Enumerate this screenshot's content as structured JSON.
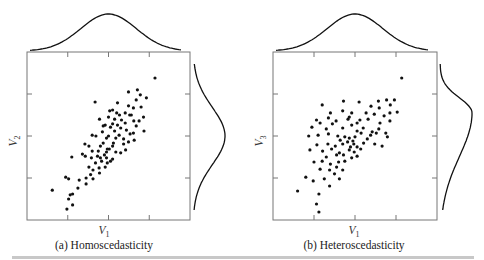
{
  "figure": {
    "bottom_rule_color": "#c8c8c8",
    "ink_color": "#111111",
    "frame_color": "#777777"
  },
  "chart_data": [
    {
      "type": "scatter",
      "title": "(a) Homoscedasticity",
      "xlabel": "V",
      "xlabel_sub": "1",
      "ylabel": "V",
      "ylabel_sub": "2",
      "xlim": [
        0,
        4
      ],
      "ylim": [
        0,
        4
      ],
      "xticks": [
        1,
        2,
        3
      ],
      "yticks": [
        1,
        2,
        3
      ],
      "tick_labels_shown": false,
      "grid": false,
      "marginals": {
        "top": "normal-symmetric",
        "right": "normal-symmetric"
      },
      "points": [
        [
          3.14,
          3.38
        ],
        [
          2.49,
          3.05
        ],
        [
          2.71,
          3.1
        ],
        [
          2.78,
          2.98
        ],
        [
          2.68,
          2.86
        ],
        [
          2.22,
          2.79
        ],
        [
          1.67,
          2.81
        ],
        [
          2.93,
          2.91
        ],
        [
          2.49,
          2.72
        ],
        [
          2.61,
          2.67
        ],
        [
          2.41,
          2.55
        ],
        [
          2.8,
          2.69
        ],
        [
          2.86,
          2.45
        ],
        [
          2.27,
          2.5
        ],
        [
          2.03,
          2.6
        ],
        [
          2.1,
          2.62
        ],
        [
          2.0,
          2.45
        ],
        [
          2.15,
          2.4
        ],
        [
          2.32,
          2.38
        ],
        [
          2.56,
          2.5
        ],
        [
          2.62,
          2.36
        ],
        [
          2.41,
          2.31
        ],
        [
          2.22,
          2.26
        ],
        [
          2.75,
          2.36
        ],
        [
          2.1,
          2.29
        ],
        [
          1.78,
          2.4
        ],
        [
          1.87,
          2.24
        ],
        [
          1.92,
          2.26
        ],
        [
          2.05,
          2.21
        ],
        [
          2.3,
          2.19
        ],
        [
          2.44,
          2.14
        ],
        [
          2.53,
          2.05
        ],
        [
          2.61,
          2.07
        ],
        [
          2.87,
          2.12
        ],
        [
          2.0,
          2.0
        ],
        [
          2.18,
          1.95
        ],
        [
          2.26,
          2.02
        ],
        [
          2.37,
          1.93
        ],
        [
          1.95,
          1.95
        ],
        [
          1.69,
          2.0
        ],
        [
          1.6,
          2.02
        ],
        [
          2.37,
          1.81
        ],
        [
          2.49,
          1.86
        ],
        [
          2.12,
          1.83
        ],
        [
          2.63,
          1.9
        ],
        [
          1.42,
          1.81
        ],
        [
          1.52,
          1.76
        ],
        [
          1.8,
          1.76
        ],
        [
          1.87,
          1.83
        ],
        [
          2.1,
          1.76
        ],
        [
          2.02,
          1.69
        ],
        [
          1.97,
          1.69
        ],
        [
          1.75,
          1.64
        ],
        [
          1.6,
          1.64
        ],
        [
          1.9,
          1.55
        ],
        [
          2.18,
          1.62
        ],
        [
          2.3,
          1.6
        ],
        [
          2.42,
          1.67
        ],
        [
          1.36,
          1.57
        ],
        [
          1.43,
          1.52
        ],
        [
          1.58,
          1.48
        ],
        [
          1.73,
          1.52
        ],
        [
          1.8,
          1.48
        ],
        [
          1.95,
          1.48
        ],
        [
          2.1,
          1.45
        ],
        [
          1.83,
          1.4
        ],
        [
          1.68,
          1.36
        ],
        [
          1.97,
          1.36
        ],
        [
          2.05,
          1.4
        ],
        [
          1.1,
          1.5
        ],
        [
          1.52,
          1.26
        ],
        [
          1.62,
          1.19
        ],
        [
          1.77,
          1.24
        ],
        [
          1.92,
          1.26
        ],
        [
          1.78,
          1.12
        ],
        [
          0.95,
          1.02
        ],
        [
          1.02,
          0.98
        ],
        [
          1.28,
          0.95
        ],
        [
          1.45,
          1.0
        ],
        [
          1.56,
          1.08
        ],
        [
          1.25,
          0.76
        ],
        [
          1.62,
          0.98
        ],
        [
          1.45,
          0.86
        ],
        [
          0.62,
          0.71
        ],
        [
          1.06,
          0.6
        ],
        [
          1.12,
          0.62
        ],
        [
          1.02,
          0.5
        ],
        [
          1.12,
          0.36
        ],
        [
          0.98,
          0.26
        ],
        [
          2.52,
          2.5
        ],
        [
          2.15,
          2.12
        ],
        [
          1.85,
          2.1
        ],
        [
          2.68,
          2.24
        ],
        [
          2.2,
          2.55
        ],
        [
          1.95,
          1.62
        ]
      ]
    },
    {
      "type": "scatter",
      "title": "(b) Heteroscedasticity",
      "xlabel": "V",
      "xlabel_sub": "1",
      "ylabel": "V",
      "ylabel_sub": "3",
      "xlim": [
        0,
        4
      ],
      "ylim": [
        0,
        4
      ],
      "xticks": [
        1,
        2,
        3
      ],
      "yticks": [
        1,
        2,
        3
      ],
      "tick_labels_shown": false,
      "grid": false,
      "marginals": {
        "top": "normal-symmetric",
        "right": "skewed"
      },
      "points": [
        [
          3.14,
          3.38
        ],
        [
          1.2,
          2.74
        ],
        [
          1.72,
          2.83
        ],
        [
          2.1,
          2.81
        ],
        [
          2.57,
          2.83
        ],
        [
          2.77,
          2.86
        ],
        [
          2.96,
          2.86
        ],
        [
          2.39,
          2.71
        ],
        [
          2.59,
          2.67
        ],
        [
          2.86,
          2.74
        ],
        [
          3.03,
          2.57
        ],
        [
          1.06,
          2.38
        ],
        [
          1.4,
          2.55
        ],
        [
          1.7,
          2.6
        ],
        [
          1.92,
          2.55
        ],
        [
          2.27,
          2.55
        ],
        [
          2.47,
          2.52
        ],
        [
          2.71,
          2.48
        ],
        [
          2.85,
          2.55
        ],
        [
          1.35,
          2.43
        ],
        [
          1.54,
          2.36
        ],
        [
          1.83,
          2.4
        ],
        [
          2.12,
          2.38
        ],
        [
          2.32,
          2.4
        ],
        [
          2.61,
          2.31
        ],
        [
          2.85,
          2.36
        ],
        [
          0.95,
          2.21
        ],
        [
          1.15,
          2.31
        ],
        [
          1.3,
          2.17
        ],
        [
          1.45,
          2.29
        ],
        [
          1.7,
          2.19
        ],
        [
          1.92,
          2.26
        ],
        [
          2.05,
          2.12
        ],
        [
          2.2,
          2.19
        ],
        [
          2.42,
          2.1
        ],
        [
          2.58,
          2.17
        ],
        [
          2.75,
          2.07
        ],
        [
          0.87,
          2.0
        ],
        [
          1.1,
          2.02
        ],
        [
          1.35,
          2.05
        ],
        [
          1.58,
          2.0
        ],
        [
          1.75,
          1.98
        ],
        [
          1.86,
          1.95
        ],
        [
          2.0,
          1.98
        ],
        [
          2.15,
          2.07
        ],
        [
          2.38,
          2.02
        ],
        [
          2.52,
          2.07
        ],
        [
          2.3,
          1.93
        ],
        [
          1.95,
          1.88
        ],
        [
          1.82,
          1.86
        ],
        [
          1.64,
          1.9
        ],
        [
          2.79,
          1.98
        ],
        [
          1.07,
          1.79
        ],
        [
          1.34,
          1.81
        ],
        [
          1.52,
          1.76
        ],
        [
          1.7,
          1.81
        ],
        [
          1.89,
          1.74
        ],
        [
          1.97,
          1.81
        ],
        [
          2.05,
          1.74
        ],
        [
          2.21,
          1.83
        ],
        [
          2.48,
          1.81
        ],
        [
          2.66,
          1.76
        ],
        [
          0.9,
          1.67
        ],
        [
          1.21,
          1.64
        ],
        [
          1.43,
          1.69
        ],
        [
          1.86,
          1.67
        ],
        [
          1.98,
          1.62
        ],
        [
          2.14,
          1.69
        ],
        [
          1.62,
          1.6
        ],
        [
          1.3,
          1.5
        ],
        [
          1.55,
          1.55
        ],
        [
          1.72,
          1.55
        ],
        [
          1.92,
          1.48
        ],
        [
          2.05,
          1.52
        ],
        [
          1.0,
          1.38
        ],
        [
          1.2,
          1.4
        ],
        [
          1.4,
          1.33
        ],
        [
          1.6,
          1.38
        ],
        [
          1.75,
          1.4
        ],
        [
          1.15,
          1.21
        ],
        [
          1.38,
          1.19
        ],
        [
          1.55,
          1.26
        ],
        [
          1.7,
          1.19
        ],
        [
          0.8,
          1.02
        ],
        [
          0.98,
          0.93
        ],
        [
          1.25,
          0.98
        ],
        [
          1.5,
          1.1
        ],
        [
          1.62,
          0.98
        ],
        [
          1.38,
          0.81
        ],
        [
          1.12,
          0.62
        ],
        [
          0.6,
          0.69
        ],
        [
          1.06,
          0.38
        ],
        [
          1.12,
          0.19
        ],
        [
          1.86,
          2.45
        ],
        [
          2.05,
          2.31
        ]
      ]
    }
  ]
}
